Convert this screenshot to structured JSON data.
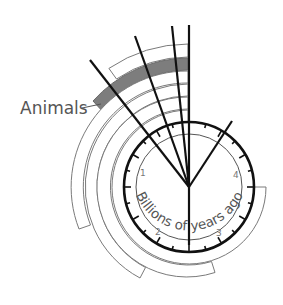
{
  "diagram": {
    "type": "geological-clock",
    "center_label": "Billions of years ago",
    "center_label_parts": [
      "Billions of",
      "years ago"
    ],
    "scale_labels": [
      "1",
      "2",
      "3",
      "4"
    ],
    "callout": {
      "label": "Animals",
      "highlight_color": "#7d7d7d"
    },
    "colors": {
      "rays": "#111111",
      "arcs": "#7a7a7a",
      "highlight": "#7d7d7d",
      "text": "#555555"
    }
  }
}
